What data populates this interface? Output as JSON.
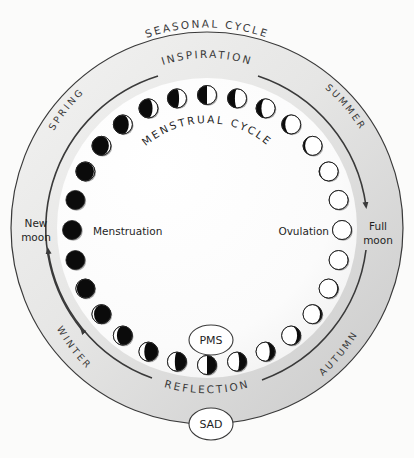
{
  "title": "Seasonal Cycle",
  "outer_ring": {
    "title": "SEASONAL CYCLE",
    "seasons": [
      {
        "name": "SPRING",
        "position": "upper-left"
      },
      {
        "name": "SUMMER",
        "position": "upper-right"
      },
      {
        "name": "AUTUMN",
        "position": "lower-right"
      },
      {
        "name": "WINTER",
        "position": "lower-left"
      }
    ]
  },
  "inner_arcs": {
    "top_label": "INSPIRATION",
    "bottom_label": "REFLECTION",
    "direction": "clockwise"
  },
  "moon_ring": {
    "title": "MENSTRUAL CYCLE",
    "moon_count": 28,
    "left_label": "New moon",
    "left_label_line1": "New",
    "left_label_line2": "moon",
    "right_label": "Full moon",
    "right_label_line1": "Full",
    "right_label_line2": "moon",
    "left_phase_label": "Menstruation",
    "right_phase_label": "Ovulation"
  },
  "badges": {
    "pms": "PMS",
    "sad": "SAD"
  },
  "colors": {
    "background": "#fbfbfa",
    "ring_fill": "#d4d4d4",
    "inner_fill": "#ffffff",
    "line": "#3a3a3a",
    "moon_dark": "#0b0b0b",
    "moon_light": "#ffffff"
  }
}
